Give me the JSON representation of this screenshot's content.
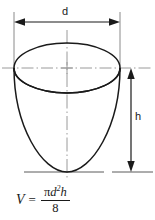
{
  "figure": {
    "background_color": "#ffffff",
    "line_color": "#1a1a1a",
    "centerline_color": "#9a9a9a"
  },
  "dimensions": {
    "diameter": {
      "label": "d",
      "orientation": "horizontal",
      "position": "top",
      "arrow_style": "double-headed"
    },
    "height": {
      "label": "h",
      "orientation": "vertical",
      "position": "right",
      "arrow_style": "double-headed"
    }
  },
  "formula": {
    "variable": "V",
    "equals": "=",
    "numerator_pi": "π",
    "numerator_d": "d",
    "numerator_exponent": "2",
    "numerator_h": "h",
    "denominator": "8",
    "plain_text": "V = πd²h / 8"
  },
  "shape": {
    "name": "paraboloid",
    "description": "open bowl / paraboloid of revolution with elliptical top opening"
  }
}
